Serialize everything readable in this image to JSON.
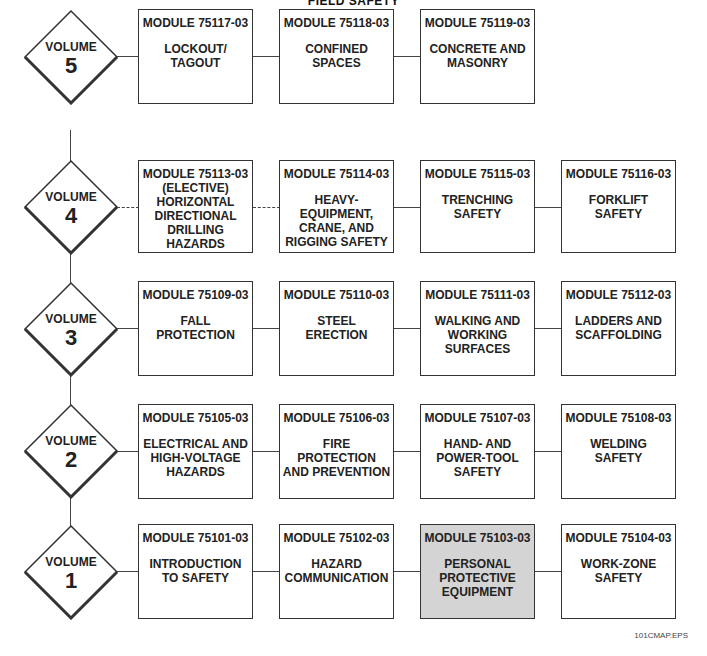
{
  "title": "FIELD SAFETY",
  "footer": "101CMAP.EPS",
  "colors": {
    "shaded_box": "#d4d4d4",
    "line": "#444444"
  },
  "volumes": [
    {
      "label": "VOLUME",
      "number": "5",
      "modules": [
        {
          "code": "MODULE 75117-03",
          "name": "LOCKOUT/\nTAGOUT"
        },
        {
          "code": "MODULE 75118-03",
          "name": "CONFINED\nSPACES"
        },
        {
          "code": "MODULE 75119-03",
          "name": "CONCRETE AND\nMASONRY"
        }
      ]
    },
    {
      "label": "VOLUME",
      "number": "4",
      "modules": [
        {
          "code": "MODULE 75113-03",
          "name": "(ELECTIVE)\nHORIZONTAL\nDIRECTIONAL\nDRILLING\nHAZARDS",
          "elective": true
        },
        {
          "code": "MODULE 75114-03",
          "name": "HEAVY-\nEQUIPMENT,\nCRANE, AND\nRIGGING SAFETY"
        },
        {
          "code": "MODULE 75115-03",
          "name": "TRENCHING\nSAFETY"
        },
        {
          "code": "MODULE 75116-03",
          "name": "FORKLIFT\nSAFETY"
        }
      ]
    },
    {
      "label": "VOLUME",
      "number": "3",
      "modules": [
        {
          "code": "MODULE 75109-03",
          "name": "FALL\nPROTECTION"
        },
        {
          "code": "MODULE 75110-03",
          "name": "STEEL\nERECTION"
        },
        {
          "code": "MODULE 75111-03",
          "name": "WALKING AND\nWORKING\nSURFACES"
        },
        {
          "code": "MODULE 75112-03",
          "name": "LADDERS AND\nSCAFFOLDING"
        }
      ]
    },
    {
      "label": "VOLUME",
      "number": "2",
      "modules": [
        {
          "code": "MODULE 75105-03",
          "name": "ELECTRICAL AND\nHIGH-VOLTAGE\nHAZARDS"
        },
        {
          "code": "MODULE 75106-03",
          "name": "FIRE\nPROTECTION\nAND PREVENTION"
        },
        {
          "code": "MODULE 75107-03",
          "name": "HAND- AND\nPOWER-TOOL\nSAFETY"
        },
        {
          "code": "MODULE 75108-03",
          "name": "WELDING\nSAFETY"
        }
      ]
    },
    {
      "label": "VOLUME",
      "number": "1",
      "modules": [
        {
          "code": "MODULE 75101-03",
          "name": "INTRODUCTION\nTO SAFETY"
        },
        {
          "code": "MODULE 75102-03",
          "name": "HAZARD\nCOMMUNICATION"
        },
        {
          "code": "MODULE 75103-03",
          "name": "PERSONAL\nPROTECTIVE\nEQUIPMENT",
          "highlighted": true
        },
        {
          "code": "MODULE 75104-03",
          "name": "WORK-ZONE\nSAFETY"
        }
      ]
    }
  ]
}
